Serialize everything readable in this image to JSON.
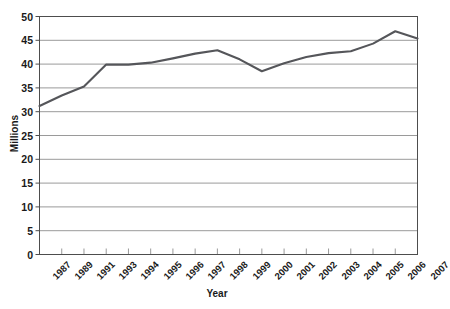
{
  "chart_data": {
    "type": "line",
    "title": "",
    "xlabel": "Year",
    "ylabel": "Millions",
    "categories": [
      "1987",
      "1989",
      "1991",
      "1993",
      "1994",
      "1995",
      "1996",
      "1997",
      "1998",
      "1999",
      "2000",
      "2001",
      "2002",
      "2003",
      "2004",
      "2005",
      "2006",
      "2007"
    ],
    "values": [
      31.2,
      33.4,
      35.3,
      39.9,
      39.9,
      40.3,
      41.2,
      42.2,
      42.9,
      41.0,
      38.5,
      40.2,
      41.5,
      42.3,
      42.7,
      44.3,
      46.9,
      45.4
    ],
    "series": [
      {
        "name": "Millions",
        "values": [
          31.2,
          33.4,
          35.3,
          39.9,
          39.9,
          40.3,
          41.2,
          42.2,
          42.9,
          41.0,
          38.5,
          40.2,
          41.5,
          42.3,
          42.7,
          44.3,
          46.9,
          45.4
        ]
      }
    ],
    "ylim": [
      0,
      50
    ],
    "yticks": [
      0,
      5,
      10,
      15,
      20,
      25,
      30,
      35,
      40,
      45,
      50
    ],
    "ytick_labels": [
      "0",
      "5",
      "10",
      "15",
      "20",
      "25",
      "30",
      "35",
      "40",
      "45",
      "50"
    ],
    "grid": "horizontal",
    "legend": "none",
    "line_color": "#55565a",
    "grid_color": "#9a9a9a",
    "axis_color": "#4d4d4d",
    "background": "#ffffff"
  }
}
